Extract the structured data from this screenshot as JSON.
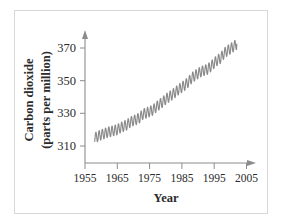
{
  "figure": {
    "border_color": "#d8d8d8",
    "background": "#ffffff",
    "axis_color": "#8c8c8c",
    "series_color": "#8a8a8a",
    "text_color": "#2b2b2b"
  },
  "chart_data": {
    "type": "line",
    "title": "",
    "xlabel": "Year",
    "ylabel": "Carbon dioxide (parts per million)",
    "ylabel_line1": "Carbon dioxide",
    "ylabel_line2": "(parts per million)",
    "xlim": [
      1953,
      2007
    ],
    "ylim": [
      303,
      378
    ],
    "grid": false,
    "legend": "none",
    "xticks": [
      1955,
      1965,
      1975,
      1985,
      1995,
      2005
    ],
    "xtick_labels": [
      "1955",
      "1965",
      "1975",
      "1985",
      "1995",
      "2005"
    ],
    "yticks": [
      310,
      330,
      350,
      370
    ],
    "ytick_labels": [
      "310",
      "330",
      "350",
      "370"
    ],
    "axis_arrows": {
      "x_axis_end": true,
      "y_axis_top": true
    },
    "series": [
      {
        "name": "Atmospheric CO2 (Mauna Loa)",
        "seasonal_oscillation": true,
        "seasonal_amplitude_ppm": 3.2,
        "x": [
          1958,
          1959,
          1960,
          1961,
          1962,
          1963,
          1964,
          1965,
          1966,
          1967,
          1968,
          1969,
          1970,
          1971,
          1972,
          1973,
          1974,
          1975,
          1976,
          1977,
          1978,
          1979,
          1980,
          1981,
          1982,
          1983,
          1984,
          1985,
          1986,
          1987,
          1988,
          1989,
          1990,
          1991,
          1992,
          1993,
          1994,
          1995,
          1996,
          1997,
          1998,
          1999,
          2000,
          2001,
          2002
        ],
        "values": [
          315.0,
          315.9,
          316.9,
          317.6,
          318.4,
          318.9,
          319.5,
          320.0,
          321.3,
          322.1,
          323.0,
          324.6,
          325.6,
          326.3,
          327.4,
          329.7,
          330.2,
          331.1,
          332.0,
          333.8,
          335.4,
          336.8,
          338.7,
          340.1,
          341.4,
          343.0,
          344.6,
          346.0,
          347.4,
          349.2,
          351.6,
          353.1,
          354.4,
          355.6,
          356.4,
          357.1,
          358.8,
          360.8,
          362.6,
          363.8,
          366.6,
          368.3,
          369.5,
          371.0,
          372.4
        ]
      }
    ]
  }
}
